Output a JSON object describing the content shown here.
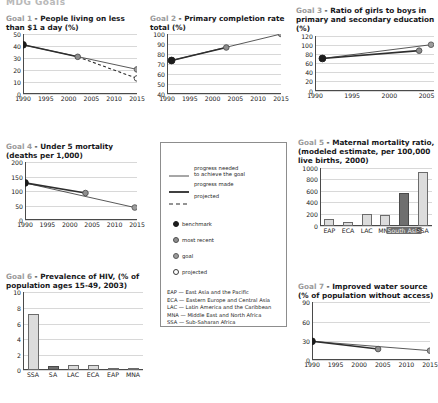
{
  "header": {
    "cut_title": "MDG Goals"
  },
  "legend": {
    "lines": [
      {
        "id": "progress-needed",
        "label": "progress needed\nto achieve the goal",
        "style": "solid-thin"
      },
      {
        "id": "progress-made",
        "label": "progress made",
        "style": "solid-thick"
      },
      {
        "id": "projected",
        "label": "projected",
        "style": "dashed"
      }
    ],
    "markers": [
      {
        "id": "benchmark",
        "label": "benchmark",
        "fill": "#1c1c1c"
      },
      {
        "id": "most-recent",
        "label": "most recent",
        "fill": "#8e8e8e"
      },
      {
        "id": "goal",
        "label": "goal",
        "fill": "#9c9c9c"
      },
      {
        "id": "projected",
        "label": "projected",
        "fill": "#ffffff"
      }
    ],
    "abbreviations": [
      "EAP — East Asia and the Pacific",
      "ECA — Eastern Europe and Central Asia",
      "LAC — Latin America and the Caribbean",
      "MNA — Middle East and North Africa",
      "SSA — Sub-Saharan Africa"
    ]
  },
  "charts": [
    {
      "id": "goal1",
      "goal_label": "Goal 1",
      "title": " - People living on less than $1 a day (%)",
      "chart_data": {
        "type": "line",
        "title": "Goal 1 - People living on less than $1 a day (%)",
        "xlabel": "",
        "ylabel": "%",
        "xlim": [
          1990,
          2015
        ],
        "ylim": [
          0,
          50
        ],
        "yticks": [
          0,
          10,
          20,
          30,
          40,
          50
        ],
        "xticks": [
          1990,
          1995,
          2000,
          2005,
          2010,
          2015
        ],
        "grid": true,
        "series": [
          {
            "name": "progress needed to achieve the goal",
            "style": "solid-thin",
            "x": [
              1990,
              2015
            ],
            "y": [
              41,
              20.5
            ]
          },
          {
            "name": "progress made",
            "style": "solid-thick",
            "x": [
              1990,
              2002
            ],
            "y": [
              41,
              31
            ]
          },
          {
            "name": "projected",
            "style": "dashed",
            "x": [
              2002,
              2015
            ],
            "y": [
              31,
              13
            ]
          }
        ],
        "points": [
          {
            "kind": "benchmark",
            "x": 1990,
            "y": 41
          },
          {
            "kind": "most recent",
            "x": 2002,
            "y": 31
          },
          {
            "kind": "goal",
            "x": 2015,
            "y": 20.5
          },
          {
            "kind": "projected",
            "x": 2015,
            "y": 13
          }
        ]
      }
    },
    {
      "id": "goal2",
      "goal_label": "Goal 2",
      "title": " - Primary completion rate total (%)",
      "chart_data": {
        "type": "line",
        "title": "Goal 2 - Primary completion rate total (%)",
        "xlabel": "",
        "ylabel": "%",
        "xlim": [
          1990,
          2015
        ],
        "ylim": [
          40,
          100
        ],
        "yticks": [
          40,
          50,
          60,
          70,
          80,
          90,
          100
        ],
        "xticks": [
          1990,
          1995,
          2000,
          2005,
          2010,
          2015
        ],
        "grid": true,
        "series": [
          {
            "name": "progress needed to achieve the goal",
            "style": "solid-thin",
            "x": [
              1991,
              2015
            ],
            "y": [
              73.5,
              100
            ]
          },
          {
            "name": "progress made",
            "style": "solid-thick",
            "x": [
              1991,
              2003
            ],
            "y": [
              73.5,
              86.5
            ]
          }
        ],
        "points": [
          {
            "kind": "benchmark",
            "x": 1991,
            "y": 73.5
          },
          {
            "kind": "most recent",
            "x": 2003,
            "y": 86.5
          },
          {
            "kind": "goal",
            "x": 2015,
            "y": 100
          }
        ]
      }
    },
    {
      "id": "goal3",
      "goal_label": "Goal 3",
      "title": " - Ratio of girls to boys in primary and secondary education (%)",
      "chart_data": {
        "type": "line",
        "title": "Goal 3 - Ratio of girls to boys in primary and secondary education (%)",
        "xlabel": "",
        "ylabel": "%",
        "xlim": [
          1990,
          2006
        ],
        "ylim": [
          0,
          120
        ],
        "yticks": [
          0,
          20,
          40,
          60,
          80,
          100,
          120
        ],
        "xticks": [
          1990,
          1995,
          2000,
          2005
        ],
        "grid": true,
        "series": [
          {
            "name": "progress needed to achieve the goal",
            "style": "solid-thin",
            "x": [
              1991,
              2005.6
            ],
            "y": [
              71,
              101
            ]
          },
          {
            "name": "progress made",
            "style": "solid-thick",
            "x": [
              1991,
              2004
            ],
            "y": [
              71,
              88
            ]
          }
        ],
        "points": [
          {
            "kind": "benchmark",
            "x": 1991,
            "y": 71
          },
          {
            "kind": "most recent",
            "x": 2004,
            "y": 88
          },
          {
            "kind": "goal",
            "x": 2005.6,
            "y": 101
          }
        ]
      }
    },
    {
      "id": "goal4",
      "goal_label": "Goal 4",
      "title": " - Under 5 mortality (deaths per 1,000)",
      "chart_data": {
        "type": "line",
        "title": "Goal 4 - Under 5 mortality (deaths per 1,000)",
        "xlabel": "",
        "ylabel": "deaths per 1,000",
        "xlim": [
          1990,
          2015
        ],
        "ylim": [
          0,
          200
        ],
        "yticks": [
          0,
          50,
          100,
          150,
          200
        ],
        "xticks": [
          1990,
          1995,
          2000,
          2005,
          2010,
          2015
        ],
        "grid": true,
        "series": [
          {
            "name": "progress needed to achieve the goal",
            "style": "solid-thin",
            "x": [
              1990,
              2014.5
            ],
            "y": [
              128,
              43
            ]
          },
          {
            "name": "progress made",
            "style": "solid-thick",
            "x": [
              1990,
              2003.5
            ],
            "y": [
              128,
              93
            ]
          }
        ],
        "points": [
          {
            "kind": "benchmark",
            "x": 1990,
            "y": 128
          },
          {
            "kind": "most recent",
            "x": 2003.5,
            "y": 93
          },
          {
            "kind": "goal",
            "x": 2014.5,
            "y": 43
          }
        ]
      }
    },
    {
      "id": "goal5",
      "goal_label": "Goal 5",
      "title": " - Maternal mortality ratio, (modeled estimate, per 100,000 live births, 2000)",
      "chart_data": {
        "type": "bar",
        "title": "Goal 5 - Maternal mortality ratio, (modeled estimate, per 100,000 live births, 2000)",
        "xlabel": "",
        "ylabel": "per 100,000 live births",
        "ylim": [
          0,
          1000
        ],
        "yticks": [
          0,
          200,
          400,
          600,
          800,
          1000
        ],
        "categories": [
          "EAP",
          "ECA",
          "LAC",
          "MNA",
          "South Asia",
          "SSA"
        ],
        "values": [
          117,
          58,
          194,
          183,
          564,
          921
        ],
        "highlighted": "South Asia",
        "grid": true
      }
    },
    {
      "id": "goal6",
      "goal_label": "Goal 6",
      "title": " - Prevalence of HIV, (% of population ages 15-49, 2003)",
      "chart_data": {
        "type": "bar",
        "title": "Goal 6 - Prevalence of HIV, (% of population ages 15-49, 2003)",
        "xlabel": "",
        "ylabel": "%",
        "ylim": [
          0,
          10
        ],
        "yticks": [
          0,
          2,
          4,
          6,
          8,
          10
        ],
        "categories": [
          "SSA",
          "SA",
          "LAC",
          "ECA",
          "EAP",
          "MNA"
        ],
        "values": [
          7.2,
          0.62,
          0.68,
          0.66,
          0.12,
          0.06
        ],
        "highlighted": "SA",
        "grid": true
      }
    },
    {
      "id": "goal7",
      "goal_label": "Goal 7",
      "title": " - Improved water source (% of population without access)",
      "chart_data": {
        "type": "line",
        "title": "Goal 7 - Improved water source (% of population without access)",
        "xlabel": "",
        "ylabel": "%",
        "xlim": [
          1990,
          2015
        ],
        "ylim": [
          0,
          90
        ],
        "yticks": [
          0,
          30,
          60,
          90
        ],
        "xticks": [
          1990,
          1995,
          2000,
          2005,
          2010,
          2015
        ],
        "grid": true,
        "series": [
          {
            "name": "progress needed to achieve the goal",
            "style": "solid-thin",
            "x": [
              1990,
              2015
            ],
            "y": [
              29,
              14.5
            ]
          },
          {
            "name": "progress made",
            "style": "solid-thick",
            "x": [
              1990,
              2004
            ],
            "y": [
              29,
              17
            ]
          }
        ],
        "points": [
          {
            "kind": "benchmark",
            "x": 1990,
            "y": 29
          },
          {
            "kind": "most recent",
            "x": 2004,
            "y": 17
          },
          {
            "kind": "goal",
            "x": 2015,
            "y": 14.5
          }
        ]
      }
    }
  ]
}
